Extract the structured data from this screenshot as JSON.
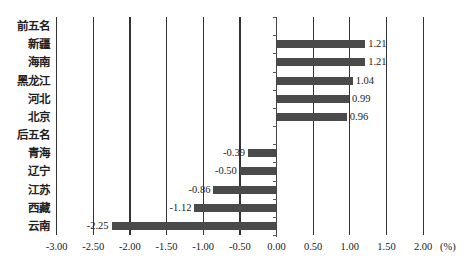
{
  "chart_data": {
    "type": "bar",
    "orientation": "horizontal",
    "title": "",
    "xlabel": "(%)",
    "ylabel": "",
    "xlim": [
      -3.0,
      2.0
    ],
    "grid": true,
    "x_ticks": [
      "-3.00",
      "-2.50",
      "-2.00",
      "-1.50",
      "-1.00",
      "-0.50",
      "0.00",
      "0.50",
      "1.00",
      "1.50",
      "2.00"
    ],
    "categories": [
      "前五名",
      "新疆",
      "海南",
      "黑龙江",
      "河北",
      "北京",
      "后五名",
      "青海",
      "辽宁",
      "江苏",
      "西藏",
      "云南"
    ],
    "values": [
      null,
      1.21,
      1.21,
      1.04,
      0.99,
      0.96,
      null,
      -0.39,
      -0.5,
      -0.86,
      -1.12,
      -2.25
    ],
    "labels": [
      "",
      "1.21",
      "1.21",
      "1.04",
      "0.99",
      "0.96",
      "",
      "-0.39",
      "-0.50",
      "-0.86",
      "-1.12",
      "-2.25"
    ],
    "bar_color": "#4a4a4a"
  }
}
